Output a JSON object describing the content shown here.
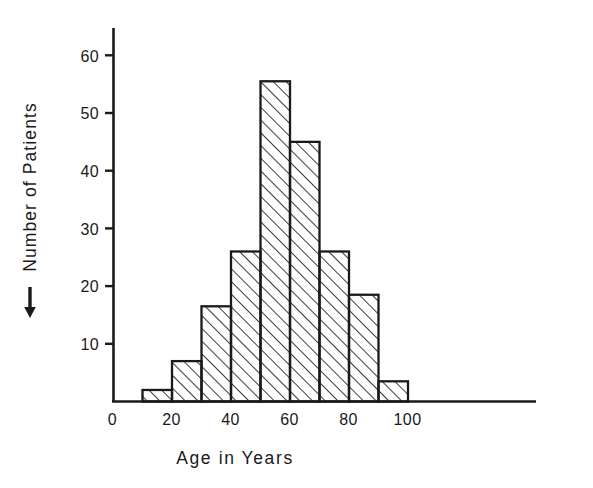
{
  "chart_data": {
    "type": "bar",
    "title": "",
    "subtitle": "",
    "xlabel": "Age in Years",
    "ylabel": "Number of Patients",
    "ylabel_prefix_icon": "up-arrow-icon",
    "categories": [
      "10-20",
      "20-30",
      "30-40",
      "40-50",
      "50-60",
      "60-70",
      "70-80",
      "80-90",
      "90-100"
    ],
    "bin_edges": [
      10,
      20,
      30,
      40,
      50,
      60,
      70,
      80,
      90,
      100
    ],
    "values": [
      2,
      7,
      16.5,
      26,
      55.5,
      45,
      26,
      18.5,
      3.5
    ],
    "xlim": [
      0,
      146
    ],
    "ylim": [
      0,
      65
    ],
    "xtick_values": [
      0,
      20,
      40,
      60,
      80,
      100
    ],
    "xtick_labels": [
      "0",
      "20",
      "40",
      "60",
      "80",
      "100"
    ],
    "ytick_values": [
      10,
      20,
      30,
      40,
      50,
      60
    ],
    "ytick_labels": [
      "10",
      "20",
      "30",
      "40",
      "50",
      "60"
    ],
    "grid": false,
    "legend": null,
    "bar_fill": "hatched-45-diagonal",
    "bar_edge_color": "#1a1a1a",
    "axis_color": "#1a1a1a",
    "background_color": "#ffffff"
  },
  "axis": {
    "y_ticks": [
      {
        "label": "60",
        "value": 60
      },
      {
        "label": "50",
        "value": 50
      },
      {
        "label": "40",
        "value": 40
      },
      {
        "label": "30",
        "value": 30
      },
      {
        "label": "20",
        "value": 20
      },
      {
        "label": "10",
        "value": 10
      }
    ],
    "x_ticks": [
      {
        "label": "0",
        "value": 0
      },
      {
        "label": "20",
        "value": 20
      },
      {
        "label": "40",
        "value": 40
      },
      {
        "label": "60",
        "value": 60
      },
      {
        "label": "80",
        "value": 80
      },
      {
        "label": "100",
        "value": 100
      }
    ]
  }
}
